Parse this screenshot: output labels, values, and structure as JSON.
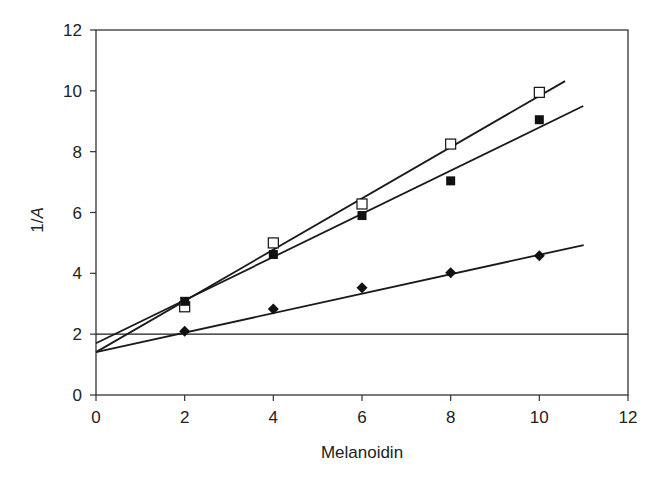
{
  "chart_data": {
    "type": "scatter",
    "title": "",
    "xlabel": "Melanoidin",
    "ylabel_prefix": "1/",
    "ylabel_italic": "A",
    "xlim": [
      0,
      12
    ],
    "ylim": [
      0,
      12
    ],
    "xticks": [
      0,
      2,
      4,
      6,
      8,
      10,
      12
    ],
    "yticks": [
      0,
      2,
      4,
      6,
      8,
      10,
      12
    ],
    "grid": false,
    "legend": null,
    "series": [
      {
        "name": "open squares",
        "marker": "open-square",
        "x": [
          2,
          4,
          6,
          8,
          10
        ],
        "y": [
          2.9,
          5.0,
          6.28,
          8.25,
          9.95
        ],
        "fit_line": {
          "x": [
            0,
            10.58
          ],
          "y": [
            1.41,
            10.32
          ]
        }
      },
      {
        "name": "filled squares",
        "marker": "filled-square",
        "x": [
          2,
          4,
          6,
          8,
          10
        ],
        "y": [
          3.08,
          4.62,
          5.9,
          7.04,
          9.05
        ],
        "fit_line": {
          "x": [
            0,
            10.99
          ],
          "y": [
            1.7,
            9.5
          ]
        }
      },
      {
        "name": "filled diamonds",
        "marker": "filled-diamond",
        "x": [
          2,
          4,
          6,
          8,
          10
        ],
        "y": [
          2.1,
          2.83,
          3.53,
          4.02,
          4.58
        ],
        "fit_line": {
          "x": [
            0,
            11
          ],
          "y": [
            1.41,
            4.93
          ]
        }
      }
    ],
    "reference_lines": [
      {
        "orientation": "horizontal",
        "y": 2,
        "x": [
          0,
          12
        ]
      }
    ]
  },
  "colors": {
    "axis": "#333333",
    "line": "#1a1a1a",
    "marker": "#111111",
    "background": "#ffffff"
  }
}
